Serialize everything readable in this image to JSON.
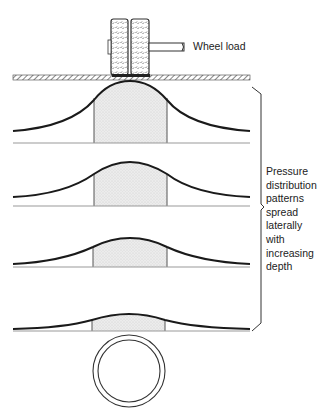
{
  "diagram": {
    "labels": {
      "wheel_load": "Wheel load",
      "pressure_note_lines": [
        "Pressure",
        "distribution",
        "patterns",
        "spread",
        "laterally",
        "with",
        "increasing",
        "depth"
      ]
    },
    "elements": {
      "wheels": 2,
      "road_surface": "hatched pavement",
      "pressure_curves": [
        {
          "level": 1,
          "baseline_y": 143,
          "peak_y": 82,
          "description": "shallowest, tallest bell curve"
        },
        {
          "level": 2,
          "baseline_y": 206,
          "peak_y": 162,
          "description": "flatter bell curve"
        },
        {
          "level": 3,
          "baseline_y": 267,
          "peak_y": 238,
          "description": "flatter still"
        },
        {
          "level": 4,
          "baseline_y": 331,
          "peak_y": 314,
          "description": "deepest, flattest curve above pipe"
        }
      ],
      "pipe": "circular pipe cross-section below deepest curve"
    },
    "colors": {
      "line": "#1a1a1a",
      "shade": "#e4e4e4",
      "baseline": "#999999"
    }
  }
}
